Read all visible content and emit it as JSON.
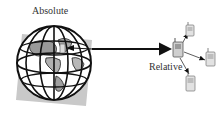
{
  "diagram": {
    "labels": {
      "absolute": "Absolute",
      "relative": "Relative"
    },
    "nodes": [
      {
        "id": "globe",
        "icon": "globe-icon",
        "role": "absolute reference"
      },
      {
        "id": "phone-center",
        "icon": "mobile-phone-icon"
      },
      {
        "id": "phone-top",
        "icon": "mobile-phone-icon"
      },
      {
        "id": "phone-right",
        "icon": "mobile-phone-icon"
      },
      {
        "id": "phone-bottom",
        "icon": "mobile-phone-icon"
      }
    ],
    "edges": [
      {
        "from": "globe",
        "to": "phone-center",
        "style": "thick, bidirectional arrowheads"
      },
      {
        "from": "phone-center",
        "to": "phone-top",
        "style": "thin"
      },
      {
        "from": "phone-center",
        "to": "phone-right",
        "style": "thin"
      },
      {
        "from": "phone-center",
        "to": "phone-bottom",
        "style": "thin"
      }
    ],
    "colors": {
      "stroke": "#111111",
      "shadow_square": "#c8c8c8",
      "land": "#9a9a9a",
      "phone_fill": "#d8d8d8",
      "text": "#333333"
    }
  }
}
